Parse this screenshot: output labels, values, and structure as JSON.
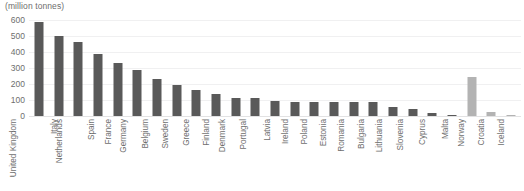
{
  "chart_data": {
    "type": "bar",
    "title": "(million tonnes)",
    "xlabel": "",
    "ylabel": "(million tonnes)",
    "ylim": [
      0,
      600
    ],
    "yticks": [
      0,
      100,
      200,
      300,
      400,
      500,
      600
    ],
    "grid": true,
    "legend": "none",
    "categories": [
      "United Kingdom",
      "Italy",
      "Netherlands",
      "Spain",
      "France",
      "Germany",
      "Belgium",
      "Sweden",
      "Greece",
      "Finland",
      "Denmark",
      "Portugal",
      "Latvia",
      "Ireland",
      "Poland",
      "Estonia",
      "Romania",
      "Bulgaria",
      "Lithuania",
      "Slovenia",
      "Cyprus",
      "Malta",
      "Norway",
      "Croatia",
      "Iceland"
    ],
    "values": [
      590,
      500,
      460,
      390,
      330,
      290,
      230,
      195,
      165,
      140,
      115,
      110,
      95,
      90,
      90,
      90,
      90,
      85,
      55,
      45,
      20,
      8,
      245,
      25,
      5
    ],
    "bar_colors": [
      "#595959",
      "#595959",
      "#595959",
      "#595959",
      "#595959",
      "#595959",
      "#595959",
      "#595959",
      "#595959",
      "#595959",
      "#595959",
      "#595959",
      "#595959",
      "#595959",
      "#595959",
      "#595959",
      "#595959",
      "#595959",
      "#595959",
      "#595959",
      "#595959",
      "#595959",
      "#b3b3b3",
      "#b3b3b3",
      "#b3b3b3"
    ],
    "colors": {
      "bar_primary": "#595959",
      "bar_secondary": "#b3b3b3",
      "gridline": "#f0f0f1",
      "axis": "#e2e2e3",
      "text": "#6e6e6e",
      "background": "#ffffff"
    }
  }
}
